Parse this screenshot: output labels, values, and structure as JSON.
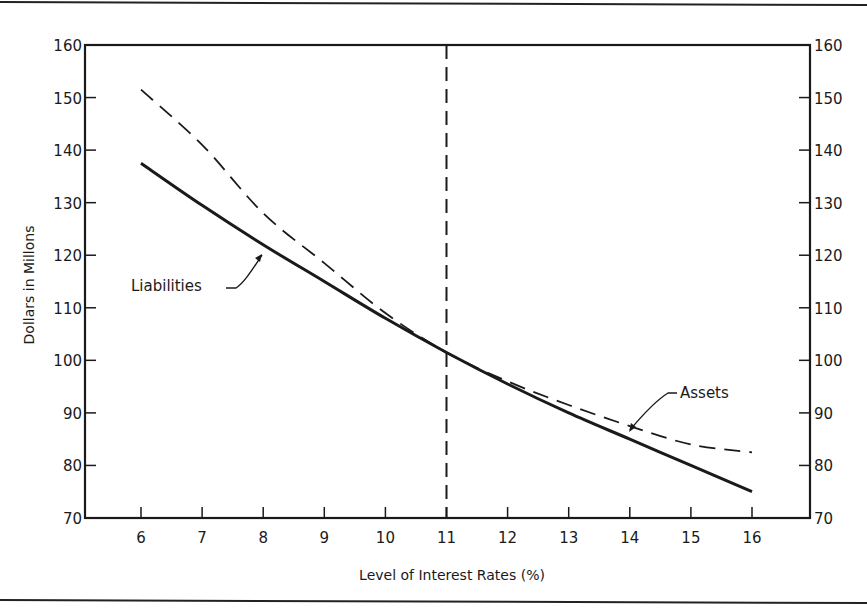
{
  "chart_data": {
    "type": "line",
    "title": "",
    "xlabel": "Level of Interest Rates (%)",
    "ylabel": "Dollars in Millons",
    "ylabel_right": "",
    "xlim": [
      5,
      17
    ],
    "ylim": [
      70,
      160
    ],
    "x_ticks": [
      6,
      7,
      8,
      9,
      10,
      11,
      12,
      13,
      14,
      15,
      16
    ],
    "y_ticks": [
      70,
      80,
      90,
      100,
      110,
      120,
      130,
      140,
      150,
      160
    ],
    "y_ticks_right": [
      70,
      80,
      90,
      100,
      110,
      120,
      130,
      140,
      150,
      160
    ],
    "grid": false,
    "legend": "none (inline annotations)",
    "x": [
      6,
      7,
      8,
      9,
      10,
      11,
      12,
      13,
      14,
      15,
      16
    ],
    "series": [
      {
        "name": "Liabilities",
        "style": "solid",
        "values": [
          137.5,
          129.5,
          122,
          115,
          108,
          101.5,
          95.5,
          90,
          85,
          80,
          75
        ]
      },
      {
        "name": "Assets",
        "style": "dashed",
        "values": [
          151.5,
          141,
          128,
          118.5,
          109,
          101.5,
          96,
          91.5,
          87.5,
          84,
          82.5
        ]
      }
    ],
    "reference_lines": [
      {
        "type": "vertical",
        "x": 11,
        "style": "dashed"
      }
    ],
    "annotations": [
      {
        "text": "Liabilities",
        "points_to_x": 8,
        "series": "Liabilities"
      },
      {
        "text": "Assets",
        "points_to_x": 14,
        "series": "Assets"
      }
    ]
  },
  "labels": {
    "xlabel": "Level of Interest Rates (%)",
    "ylabel": "Dollars in Millons",
    "liabilities": "Liabilities",
    "assets": "Assets"
  }
}
